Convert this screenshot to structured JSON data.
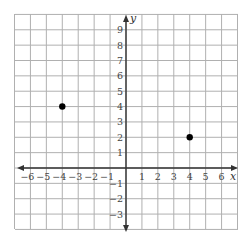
{
  "graph": {
    "x_axis_label": "x",
    "y_axis_label": "y",
    "x_range": [
      -7,
      7
    ],
    "y_range": [
      -4,
      10
    ],
    "x_ticks": [
      "−6",
      "−5",
      "−4",
      "−3",
      "−2",
      "−1",
      "1",
      "2",
      "3",
      "4",
      "5",
      "6"
    ],
    "x_tick_values": [
      -6,
      -5,
      -4,
      -3,
      -2,
      -1,
      1,
      2,
      3,
      4,
      5,
      6
    ],
    "y_ticks": [
      "9",
      "8",
      "7",
      "6",
      "5",
      "4",
      "3",
      "2",
      "1",
      "−1",
      "−2",
      "−3"
    ],
    "y_tick_values": [
      9,
      8,
      7,
      6,
      5,
      4,
      3,
      2,
      1,
      -1,
      -2,
      -3
    ],
    "points": [
      {
        "x": -4,
        "y": 4
      },
      {
        "x": 4,
        "y": 2
      }
    ],
    "colors": {
      "grid": "#b0b0b0",
      "axis": "#333333",
      "point": "#000000"
    }
  }
}
